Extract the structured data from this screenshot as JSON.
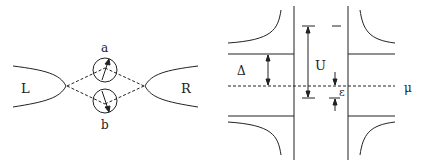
{
  "left_panel": {
    "lead_left_label": "L",
    "lead_right_label": "R",
    "dot_top_label": "a",
    "dot_bottom_label": "b"
  },
  "right_panel": {
    "gap_label": "Δ",
    "charging_label": "U",
    "level_label": "ε",
    "chemical_potential_label": "μ"
  },
  "colors": {
    "line": "#222222",
    "background": "#ffffff"
  }
}
